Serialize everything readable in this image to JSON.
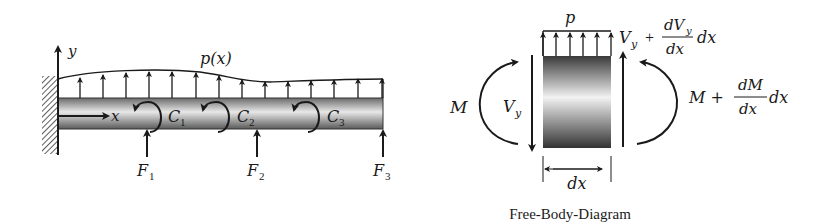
{
  "left_diagram": {
    "name": "cantilever-beam",
    "axis_y_label": "y",
    "axis_x_label": "x",
    "load_label": "p(x)",
    "couples": [
      {
        "label": "C",
        "sub": "1"
      },
      {
        "label": "C",
        "sub": "2"
      },
      {
        "label": "C",
        "sub": "3"
      }
    ],
    "forces": [
      {
        "label": "F",
        "sub": "1"
      },
      {
        "label": "F",
        "sub": "2"
      },
      {
        "label": "F",
        "sub": "3"
      }
    ]
  },
  "right_diagram": {
    "name": "free-body-diagram",
    "load_label": "p",
    "left_moment": "M",
    "left_shear": "V",
    "left_shear_sub": "y",
    "right_shear_base": "V",
    "right_shear_sub": "y",
    "right_shear_plus": "+",
    "right_shear_num": "dV",
    "right_shear_num_sub": "y",
    "right_shear_den": "dx",
    "right_shear_tail": "dx",
    "right_moment_base": "M +",
    "right_moment_num": "dM",
    "right_moment_den": "dx",
    "right_moment_tail": "dx",
    "width_label": "dx",
    "caption": "Free-Body-Diagram"
  }
}
